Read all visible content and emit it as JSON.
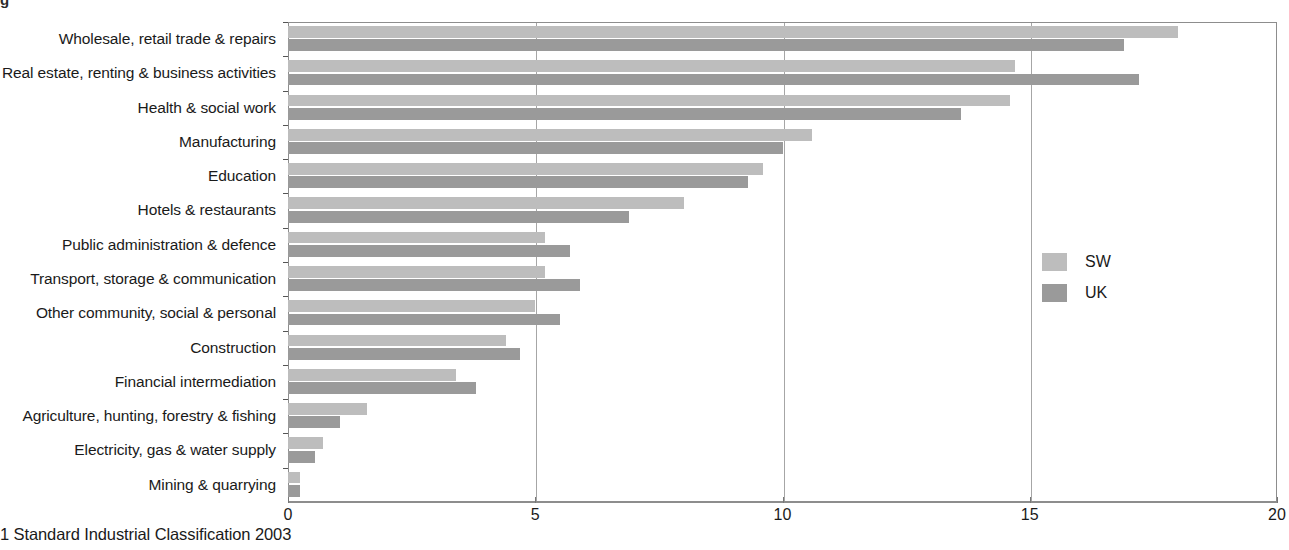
{
  "top_cropped_text": "g",
  "footnote": "1 Standard Industrial Classification 2003",
  "legend": {
    "position": "right-middle",
    "items": [
      {
        "label": "SW",
        "color": "#bdbdbd"
      },
      {
        "label": "UK",
        "color": "#9a9a9a"
      }
    ]
  },
  "chart_data": {
    "type": "bar",
    "orientation": "horizontal",
    "title": "",
    "subtitle": "",
    "xlabel": "",
    "ylabel": "",
    "xlim": [
      0,
      20
    ],
    "xticks": [
      0,
      5,
      10,
      15,
      20
    ],
    "xtick_labels": [
      "0",
      "5",
      "10",
      "15",
      "20"
    ],
    "grid": "vertical",
    "legend_position": "right",
    "categories": [
      "Wholesale, retail trade & repairs",
      "Real estate, renting & business activities",
      "Health & social work",
      "Manufacturing",
      "Education",
      "Hotels & restaurants",
      "Public administration & defence",
      "Transport, storage & communication",
      "Other community, social & personal",
      "Construction",
      "Financial intermediation",
      "Agriculture, hunting, forestry & fishing",
      "Electricity, gas & water supply",
      "Mining & quarrying"
    ],
    "series": [
      {
        "name": "SW",
        "color": "#bdbdbd",
        "values": [
          18.0,
          14.7,
          14.6,
          10.6,
          9.6,
          8.0,
          5.2,
          5.2,
          5.0,
          4.4,
          3.4,
          1.6,
          0.7,
          0.25
        ]
      },
      {
        "name": "UK",
        "color": "#9a9a9a",
        "values": [
          16.9,
          17.2,
          13.6,
          10.0,
          9.3,
          6.9,
          5.7,
          5.9,
          5.5,
          4.7,
          3.8,
          1.05,
          0.55,
          0.25
        ]
      }
    ]
  }
}
